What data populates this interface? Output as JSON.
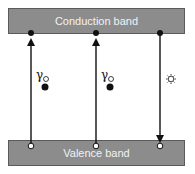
{
  "diagram": {
    "conduction_band": {
      "label": "Conduction band"
    },
    "valence_band": {
      "label": "Valence band"
    },
    "transitions": [
      {
        "x": 31,
        "direction": "up",
        "icon": "photon-absorption-icon"
      },
      {
        "x": 96,
        "direction": "up",
        "icon": "photon-absorption-icon"
      },
      {
        "x": 160,
        "direction": "down",
        "icon": "light-emission-icon"
      }
    ],
    "colors": {
      "band_fill": "#8c8c8c",
      "band_text": "#f2f2f2",
      "line": "#111111"
    }
  }
}
